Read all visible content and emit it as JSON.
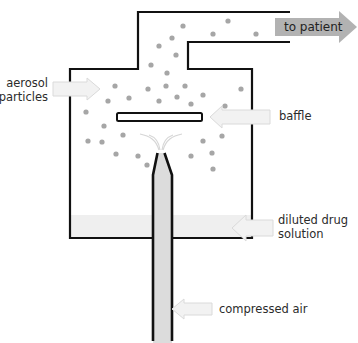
{
  "diagram": {
    "labels": {
      "to_patient": "to patient",
      "aerosol_line1": "aerosol",
      "aerosol_line2": "particles",
      "baffle": "baffle",
      "diluted_line1": "diluted drug",
      "diluted_line2": "solution",
      "compressed_air": "compressed air"
    },
    "colors": {
      "outline": "#111111",
      "particle": "#a6a6a6",
      "solution_fill": "#efefef",
      "air_tube_fill": "#dcdcdc",
      "callout_arrow_fill": "#f2f2f2",
      "callout_arrow_stroke": "#dadada",
      "outlet_arrow_fill": "#b2b2b2",
      "spray": "#d6d6d6"
    },
    "particles": [
      [
        183,
        26
      ],
      [
        228,
        21
      ],
      [
        213,
        34
      ],
      [
        256,
        34
      ],
      [
        172,
        38
      ],
      [
        159,
        46
      ],
      [
        176,
        55
      ],
      [
        151,
        65
      ],
      [
        167,
        73
      ],
      [
        115,
        86
      ],
      [
        148,
        89
      ],
      [
        166,
        86
      ],
      [
        185,
        86
      ],
      [
        241,
        89
      ],
      [
        108,
        101
      ],
      [
        129,
        98
      ],
      [
        159,
        101
      ],
      [
        177,
        97
      ],
      [
        203,
        95
      ],
      [
        191,
        104
      ],
      [
        225,
        106
      ],
      [
        86,
        112
      ],
      [
        104,
        126
      ],
      [
        123,
        135
      ],
      [
        88,
        141
      ],
      [
        102,
        142
      ],
      [
        116,
        154
      ],
      [
        138,
        156
      ],
      [
        147,
        165
      ],
      [
        203,
        141
      ],
      [
        222,
        136
      ],
      [
        191,
        156
      ],
      [
        212,
        153
      ],
      [
        213,
        169
      ]
    ]
  }
}
